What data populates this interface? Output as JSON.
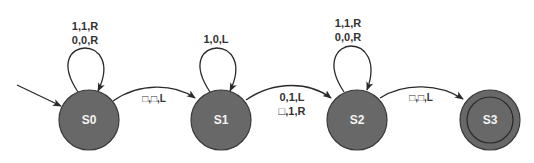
{
  "diagram": {
    "type": "turing-machine-state-diagram",
    "colors": {
      "node_fill": "#686868",
      "node_stroke": "#3a3a3a",
      "edge": "#2a2a2a",
      "node_text": "#f4f4f4",
      "edge_text": "#333333",
      "background": "#ffffff"
    },
    "states": [
      {
        "id": "S0",
        "label": "S0",
        "initial": true,
        "accepting": false
      },
      {
        "id": "S1",
        "label": "S1",
        "initial": false,
        "accepting": false
      },
      {
        "id": "S2",
        "label": "S2",
        "initial": false,
        "accepting": false
      },
      {
        "id": "S3",
        "label": "S3",
        "initial": false,
        "accepting": true
      }
    ],
    "transitions": {
      "s0_loop": {
        "from": "S0",
        "to": "S0",
        "labels": [
          "1,1,R",
          "0,0,R"
        ]
      },
      "s0_s1": {
        "from": "S0",
        "to": "S1",
        "labels": [
          "□,□,L"
        ]
      },
      "s1_loop": {
        "from": "S1",
        "to": "S1",
        "labels": [
          "1,0,L"
        ]
      },
      "s1_s2": {
        "from": "S1",
        "to": "S2",
        "labels": [
          "0,1,L",
          "□,1,R"
        ]
      },
      "s2_loop": {
        "from": "S2",
        "to": "S2",
        "labels": [
          "1,1,R",
          "0,0,R"
        ]
      },
      "s2_s3": {
        "from": "S2",
        "to": "S3",
        "labels": [
          "□,□,L"
        ]
      }
    }
  }
}
